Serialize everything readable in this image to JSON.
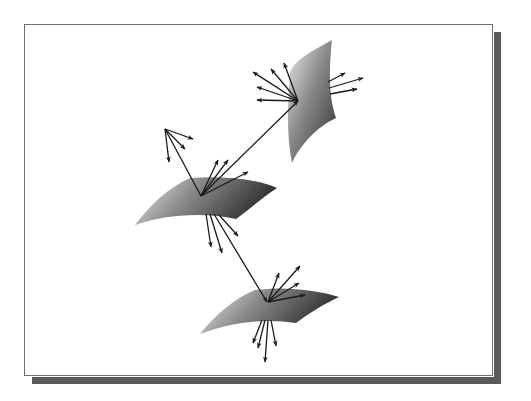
{
  "diagram": {
    "colors": {
      "frame_border": "#6e6e6e",
      "drop_shadow": "#5a5a5a",
      "arrow": "#1a1a1a",
      "surface_light": "#e6e6e6",
      "surface_dark": "#3a3a3a"
    },
    "surfaces": [
      {
        "id": "top-surface",
        "path": "M332,40 C318,48 296,58 290,72 C288,100 286,135 292,163 C300,145 318,126 336,118 C330,100 328,78 332,40 Z",
        "gradient": "gradTop"
      },
      {
        "id": "middle-surface",
        "path": "M135,225 C150,205 168,188 190,178 C220,176 255,178 277,188 C262,198 248,210 236,219 C205,212 165,214 135,225 Z",
        "gradient": "gradMid"
      },
      {
        "id": "bottom-surface",
        "path": "M200,334 C215,315 235,298 255,290 C285,286 318,290 339,297 C322,305 308,314 296,323 C266,318 230,322 200,334 Z",
        "gradient": "gradBot"
      }
    ],
    "arrows": [
      {
        "id": "top-ray-1",
        "x1": 298,
        "y1": 101,
        "x2": 253,
        "y2": 72
      },
      {
        "id": "top-ray-2",
        "x1": 298,
        "y1": 101,
        "x2": 271,
        "y2": 69
      },
      {
        "id": "top-ray-3",
        "x1": 298,
        "y1": 101,
        "x2": 284,
        "y2": 63
      },
      {
        "id": "top-ray-4",
        "x1": 298,
        "y1": 101,
        "x2": 257,
        "y2": 87
      },
      {
        "id": "top-ray-5",
        "x1": 298,
        "y1": 101,
        "x2": 257,
        "y2": 100
      },
      {
        "id": "top-right-ray-1",
        "x1": 328,
        "y1": 82,
        "x2": 345,
        "y2": 73
      },
      {
        "id": "top-right-ray-2",
        "x1": 329,
        "y1": 88,
        "x2": 363,
        "y2": 78
      },
      {
        "id": "top-right-ray-3",
        "x1": 330,
        "y1": 94,
        "x2": 357,
        "y2": 89
      },
      {
        "id": "connect-mid-to-top",
        "x1": 201,
        "y1": 196,
        "x2": 298,
        "y2": 101
      },
      {
        "id": "upper-left-ray-1",
        "x1": 165,
        "y1": 129,
        "x2": 193,
        "y2": 139
      },
      {
        "id": "upper-left-ray-2",
        "x1": 165,
        "y1": 129,
        "x2": 185,
        "y2": 149
      },
      {
        "id": "upper-left-ray-3",
        "x1": 165,
        "y1": 129,
        "x2": 169,
        "y2": 162
      },
      {
        "id": "upper-left-to-mid",
        "x1": 201,
        "y1": 196,
        "x2": 165,
        "y2": 129,
        "noHead": true
      },
      {
        "id": "mid-ray-1",
        "x1": 201,
        "y1": 196,
        "x2": 218,
        "y2": 160
      },
      {
        "id": "mid-ray-2",
        "x1": 201,
        "y1": 196,
        "x2": 228,
        "y2": 160
      },
      {
        "id": "mid-ray-3",
        "x1": 201,
        "y1": 196,
        "x2": 248,
        "y2": 172
      },
      {
        "id": "mid-down-ray-1",
        "x1": 206,
        "y1": 214,
        "x2": 211,
        "y2": 247
      },
      {
        "id": "mid-down-ray-2",
        "x1": 210,
        "y1": 214,
        "x2": 222,
        "y2": 253
      },
      {
        "id": "mid-down-ray-3",
        "x1": 219,
        "y1": 215,
        "x2": 238,
        "y2": 236
      },
      {
        "id": "connect-mid-to-bottom",
        "x1": 214,
        "y1": 214,
        "x2": 267,
        "y2": 302
      },
      {
        "id": "bottom-ray-1",
        "x1": 268,
        "y1": 302,
        "x2": 279,
        "y2": 273
      },
      {
        "id": "bottom-ray-2",
        "x1": 268,
        "y1": 302,
        "x2": 300,
        "y2": 266
      },
      {
        "id": "bottom-ray-3",
        "x1": 268,
        "y1": 302,
        "x2": 299,
        "y2": 283
      },
      {
        "id": "bottom-ray-4",
        "x1": 268,
        "y1": 302,
        "x2": 305,
        "y2": 295
      },
      {
        "id": "bottom-down-ray-1",
        "x1": 262,
        "y1": 320,
        "x2": 253,
        "y2": 343
      },
      {
        "id": "bottom-down-ray-2",
        "x1": 265,
        "y1": 320,
        "x2": 258,
        "y2": 348
      },
      {
        "id": "bottom-down-ray-3",
        "x1": 268,
        "y1": 320,
        "x2": 265,
        "y2": 362
      },
      {
        "id": "bottom-down-ray-4",
        "x1": 271,
        "y1": 320,
        "x2": 276,
        "y2": 346
      }
    ]
  }
}
